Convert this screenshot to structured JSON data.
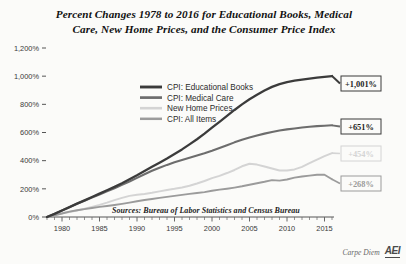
{
  "chart_data": {
    "type": "line",
    "title": "Percent Changes 1978 to 2016 for Educational Books, Medical Care, New Home Prices, and the Consumer Price Index",
    "title_line1": "Percent Changes 1978 to 2016 for Educational Books, Medical",
    "title_line2": "Care, New Home Prices, and the Consumer Price Index",
    "xlabel": "",
    "ylabel": "",
    "xlim": [
      1978,
      2016
    ],
    "ylim": [
      0,
      1200
    ],
    "grid": false,
    "legend_position": "upper-center-left",
    "source_note": "Sources: Bureau of Labor Statistics and Census Bureau",
    "ytick_labels": [
      "0%",
      "200%",
      "400%",
      "600%",
      "800%",
      "1,000%",
      "1,200%"
    ],
    "ytick_values": [
      0,
      200,
      400,
      600,
      800,
      1000,
      1200
    ],
    "xtick_labels": [
      "1980",
      "1985",
      "1990",
      "1995",
      "2000",
      "2005",
      "2010",
      "2015"
    ],
    "xtick_values": [
      1980,
      1985,
      1990,
      1995,
      2000,
      2005,
      2010,
      2015
    ],
    "x": [
      1978,
      1979,
      1980,
      1981,
      1982,
      1983,
      1984,
      1985,
      1986,
      1987,
      1988,
      1989,
      1990,
      1991,
      1992,
      1993,
      1994,
      1995,
      1996,
      1997,
      1998,
      1999,
      2000,
      2001,
      2002,
      2003,
      2004,
      2005,
      2006,
      2007,
      2008,
      2009,
      2010,
      2011,
      2012,
      2013,
      2014,
      2015,
      2016
    ],
    "series": [
      {
        "name": "CPI: Educational Books",
        "color": "#3b3b3b",
        "width": 2.3,
        "end_label": "+1,001%",
        "end_value": 1001,
        "values": [
          0,
          22,
          46,
          70,
          95,
          118,
          142,
          166,
          190,
          214,
          240,
          268,
          296,
          326,
          356,
          386,
          416,
          448,
          480,
          516,
          552,
          592,
          634,
          676,
          718,
          760,
          800,
          836,
          868,
          898,
          924,
          944,
          958,
          968,
          976,
          983,
          989,
          995,
          1001
        ]
      },
      {
        "name": "CPI: Medical Care",
        "color": "#6d6d6d",
        "width": 2.1,
        "end_label": "+651%",
        "end_value": 651,
        "values": [
          0,
          22,
          46,
          70,
          94,
          116,
          138,
          160,
          182,
          204,
          228,
          252,
          278,
          304,
          328,
          350,
          370,
          388,
          404,
          420,
          436,
          452,
          470,
          490,
          510,
          530,
          548,
          564,
          578,
          592,
          604,
          614,
          622,
          629,
          635,
          641,
          645,
          648,
          651
        ]
      },
      {
        "name": "New Home Prices",
        "color": "#d4d4d4",
        "width": 2.0,
        "end_label": "+454%",
        "end_value": 454,
        "values": [
          0,
          14,
          26,
          36,
          46,
          58,
          72,
          86,
          102,
          120,
          136,
          150,
          158,
          164,
          172,
          182,
          192,
          200,
          210,
          222,
          238,
          256,
          276,
          292,
          312,
          334,
          360,
          378,
          372,
          358,
          344,
          330,
          330,
          338,
          356,
          382,
          408,
          432,
          454
        ]
      },
      {
        "name": "CPI: All Items",
        "color": "#9b9b9b",
        "width": 1.9,
        "end_label": "+268%",
        "end_value": 268,
        "values": [
          0,
          11,
          25,
          38,
          48,
          56,
          64,
          72,
          78,
          85,
          93,
          102,
          112,
          121,
          128,
          136,
          143,
          150,
          157,
          164,
          170,
          177,
          186,
          194,
          201,
          209,
          218,
          229,
          240,
          250,
          262,
          258,
          266,
          280,
          288,
          294,
          300,
          300,
          268
        ]
      }
    ]
  },
  "brand": {
    "text": "Carpe Diem",
    "logo": "AEI"
  }
}
